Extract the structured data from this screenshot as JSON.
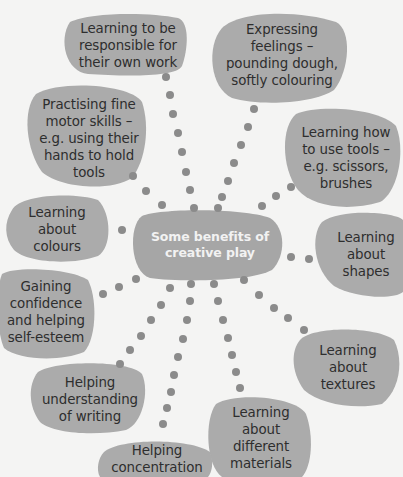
{
  "colors": {
    "background": "#f4f4f3",
    "blob": "#ababab",
    "center_blob": "#a6a6a6",
    "dot": "#8b8b8b",
    "text": "#2e2e2e",
    "center_text": "#f2f2f2"
  },
  "center": {
    "label": "Some benefits of\ncreative play"
  },
  "benefits": [
    {
      "id": "responsible",
      "label": "Learning to be\nresponsible for\ntheir own work"
    },
    {
      "id": "expressing",
      "label": "Expressing\nfeelings –\npounding dough,\nsoftly colouring"
    },
    {
      "id": "fine-motor",
      "label": "Practising fine\nmotor skills –\ne.g. using their\nhands to hold\ntools"
    },
    {
      "id": "tools",
      "label": "Learning how\nto use tools –\ne.g. scissors,\nbrushes"
    },
    {
      "id": "colours",
      "label": "Learning\nabout\ncolours"
    },
    {
      "id": "shapes",
      "label": "Learning\nabout\nshapes"
    },
    {
      "id": "confidence",
      "label": "Gaining\nconfidence\nand helping\nself-esteem"
    },
    {
      "id": "textures",
      "label": "Learning\nabout\ntextures"
    },
    {
      "id": "writing",
      "label": "Helping\nunderstanding\nof writing"
    },
    {
      "id": "materials",
      "label": "Learning\nabout\ndifferent\nmaterials"
    },
    {
      "id": "concentration",
      "label": "Helping\nconcentration"
    }
  ]
}
